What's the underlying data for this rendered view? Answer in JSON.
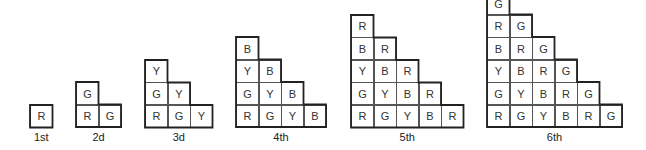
{
  "figures": [
    {
      "label": "1st",
      "x": 30,
      "rows": [
        [
          "R"
        ]
      ]
    },
    {
      "label": "2d",
      "x": 76,
      "rows": [
        [
          "G"
        ],
        [
          "R",
          "G"
        ]
      ]
    },
    {
      "label": "3d",
      "x": 145,
      "rows": [
        [
          "Y"
        ],
        [
          "G",
          "Y"
        ],
        [
          "R",
          "G",
          "Y"
        ]
      ]
    },
    {
      "label": "4th",
      "x": 236,
      "rows": [
        [
          "B"
        ],
        [
          "Y",
          "B"
        ],
        [
          "G",
          "Y",
          "B"
        ],
        [
          "R",
          "G",
          "Y",
          "B"
        ]
      ]
    },
    {
      "label": "5th",
      "x": 351,
      "rows": [
        [
          "R"
        ],
        [
          "B",
          "R"
        ],
        [
          "Y",
          "B",
          "R"
        ],
        [
          "G",
          "Y",
          "B",
          "R"
        ],
        [
          "R",
          "G",
          "Y",
          "B",
          "R"
        ]
      ]
    },
    {
      "label": "6th",
      "x": 487,
      "rows": [
        [
          "G"
        ],
        [
          "R",
          "G"
        ],
        [
          "B",
          "R",
          "G"
        ],
        [
          "Y",
          "B",
          "R",
          "G"
        ],
        [
          "G",
          "Y",
          "B",
          "R",
          "G"
        ],
        [
          "R",
          "G",
          "Y",
          "B",
          "R",
          "G"
        ]
      ]
    }
  ],
  "layout": {
    "cell_size": 22.5,
    "baseline_y": 127,
    "label_y": 131
  }
}
